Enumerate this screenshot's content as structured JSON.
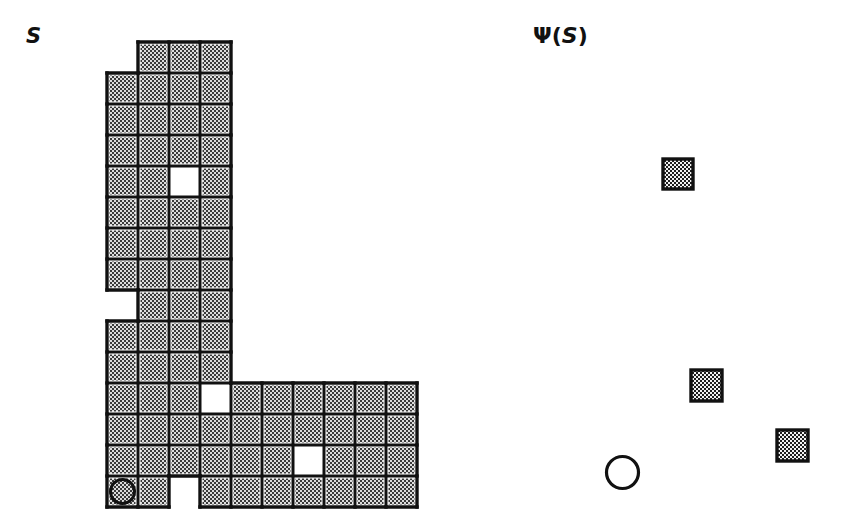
{
  "figure": {
    "title_left": "S",
    "title_right": "Ψ(S)",
    "title_right_parts": {
      "psi": "Ψ",
      "open": "(",
      "arg": "S",
      "close": ")"
    },
    "background_color": "#ffffff",
    "ink_color": "#111111",
    "cell_fill_color": "#d4d4d4",
    "stipple_dot_color": "#2a2a2a",
    "cell_size_px": 31,
    "grid_origin": {
      "x": 107,
      "y": 42
    },
    "line_width_px": 3
  },
  "chart_data": {
    "type": "diagram",
    "left_panel": {
      "label": "S",
      "description": "L-shaped polyomino drawn as a grid of stipple-filled square cells outlined in black, containing three white (empty) interior cells and one circular marker cell at the lower-left corner.",
      "columns": 10,
      "rows": 15,
      "cell_size": 31,
      "origin": {
        "x": 107,
        "y": 42
      },
      "legend": {
        "filled": "stippled gray cell (member of S)",
        "hole": "white cell (hole / excluded)",
        "circle": "circle marker cell (distinguished origin cell)"
      },
      "cells": [
        {
          "col": 1,
          "row": 0,
          "state": "filled"
        },
        {
          "col": 2,
          "row": 0,
          "state": "filled"
        },
        {
          "col": 3,
          "row": 0,
          "state": "filled"
        },
        {
          "col": 0,
          "row": 1,
          "state": "filled"
        },
        {
          "col": 1,
          "row": 1,
          "state": "filled"
        },
        {
          "col": 2,
          "row": 1,
          "state": "filled"
        },
        {
          "col": 3,
          "row": 1,
          "state": "filled"
        },
        {
          "col": 0,
          "row": 2,
          "state": "filled"
        },
        {
          "col": 1,
          "row": 2,
          "state": "filled"
        },
        {
          "col": 2,
          "row": 2,
          "state": "filled"
        },
        {
          "col": 3,
          "row": 2,
          "state": "filled"
        },
        {
          "col": 0,
          "row": 3,
          "state": "filled"
        },
        {
          "col": 1,
          "row": 3,
          "state": "filled"
        },
        {
          "col": 2,
          "row": 3,
          "state": "filled"
        },
        {
          "col": 3,
          "row": 3,
          "state": "filled"
        },
        {
          "col": 0,
          "row": 4,
          "state": "filled"
        },
        {
          "col": 1,
          "row": 4,
          "state": "filled"
        },
        {
          "col": 2,
          "row": 4,
          "state": "hole"
        },
        {
          "col": 3,
          "row": 4,
          "state": "filled"
        },
        {
          "col": 0,
          "row": 5,
          "state": "filled"
        },
        {
          "col": 1,
          "row": 5,
          "state": "filled"
        },
        {
          "col": 2,
          "row": 5,
          "state": "filled"
        },
        {
          "col": 3,
          "row": 5,
          "state": "filled"
        },
        {
          "col": 0,
          "row": 6,
          "state": "filled"
        },
        {
          "col": 1,
          "row": 6,
          "state": "filled"
        },
        {
          "col": 2,
          "row": 6,
          "state": "filled"
        },
        {
          "col": 3,
          "row": 6,
          "state": "filled"
        },
        {
          "col": 0,
          "row": 7,
          "state": "filled"
        },
        {
          "col": 1,
          "row": 7,
          "state": "filled"
        },
        {
          "col": 2,
          "row": 7,
          "state": "filled"
        },
        {
          "col": 3,
          "row": 7,
          "state": "filled"
        },
        {
          "col": 1,
          "row": 8,
          "state": "filled"
        },
        {
          "col": 2,
          "row": 8,
          "state": "filled"
        },
        {
          "col": 3,
          "row": 8,
          "state": "filled"
        },
        {
          "col": 0,
          "row": 9,
          "state": "filled"
        },
        {
          "col": 1,
          "row": 9,
          "state": "filled"
        },
        {
          "col": 2,
          "row": 9,
          "state": "filled"
        },
        {
          "col": 3,
          "row": 9,
          "state": "filled"
        },
        {
          "col": 0,
          "row": 10,
          "state": "filled"
        },
        {
          "col": 1,
          "row": 10,
          "state": "filled"
        },
        {
          "col": 2,
          "row": 10,
          "state": "filled"
        },
        {
          "col": 3,
          "row": 10,
          "state": "filled"
        },
        {
          "col": 0,
          "row": 11,
          "state": "filled"
        },
        {
          "col": 1,
          "row": 11,
          "state": "filled"
        },
        {
          "col": 2,
          "row": 11,
          "state": "filled"
        },
        {
          "col": 3,
          "row": 11,
          "state": "hole"
        },
        {
          "col": 4,
          "row": 11,
          "state": "filled"
        },
        {
          "col": 5,
          "row": 11,
          "state": "filled"
        },
        {
          "col": 6,
          "row": 11,
          "state": "filled"
        },
        {
          "col": 7,
          "row": 11,
          "state": "filled"
        },
        {
          "col": 8,
          "row": 11,
          "state": "filled"
        },
        {
          "col": 9,
          "row": 11,
          "state": "filled"
        },
        {
          "col": 0,
          "row": 12,
          "state": "filled"
        },
        {
          "col": 1,
          "row": 12,
          "state": "filled"
        },
        {
          "col": 2,
          "row": 12,
          "state": "filled"
        },
        {
          "col": 3,
          "row": 12,
          "state": "filled"
        },
        {
          "col": 4,
          "row": 12,
          "state": "filled"
        },
        {
          "col": 5,
          "row": 12,
          "state": "filled"
        },
        {
          "col": 6,
          "row": 12,
          "state": "filled"
        },
        {
          "col": 7,
          "row": 12,
          "state": "filled"
        },
        {
          "col": 8,
          "row": 12,
          "state": "filled"
        },
        {
          "col": 9,
          "row": 12,
          "state": "filled"
        },
        {
          "col": 0,
          "row": 13,
          "state": "filled"
        },
        {
          "col": 1,
          "row": 13,
          "state": "filled"
        },
        {
          "col": 2,
          "row": 13,
          "state": "filled"
        },
        {
          "col": 3,
          "row": 13,
          "state": "filled"
        },
        {
          "col": 4,
          "row": 13,
          "state": "filled"
        },
        {
          "col": 5,
          "row": 13,
          "state": "filled"
        },
        {
          "col": 6,
          "row": 13,
          "state": "hole"
        },
        {
          "col": 7,
          "row": 13,
          "state": "filled"
        },
        {
          "col": 8,
          "row": 13,
          "state": "filled"
        },
        {
          "col": 9,
          "row": 13,
          "state": "filled"
        },
        {
          "col": 0,
          "row": 14,
          "state": "circle"
        },
        {
          "col": 1,
          "row": 14,
          "state": "filled"
        },
        {
          "col": 3,
          "row": 14,
          "state": "filled"
        },
        {
          "col": 4,
          "row": 14,
          "state": "filled"
        },
        {
          "col": 5,
          "row": 14,
          "state": "filled"
        },
        {
          "col": 6,
          "row": 14,
          "state": "filled"
        },
        {
          "col": 7,
          "row": 14,
          "state": "filled"
        },
        {
          "col": 8,
          "row": 14,
          "state": "filled"
        },
        {
          "col": 9,
          "row": 14,
          "state": "filled"
        }
      ]
    },
    "right_panel": {
      "label": "Ψ(S)",
      "description": "Sparse scatter of three small stipple-filled squares and one open circle marker.",
      "marker_size": 30,
      "markers": [
        {
          "kind": "square",
          "x": 663,
          "y": 159,
          "size": 30
        },
        {
          "kind": "square",
          "x": 691,
          "y": 370,
          "size": 31
        },
        {
          "kind": "square",
          "x": 777,
          "y": 430,
          "size": 31
        },
        {
          "kind": "circle",
          "x": 605,
          "y": 455,
          "size": 35
        }
      ]
    }
  }
}
